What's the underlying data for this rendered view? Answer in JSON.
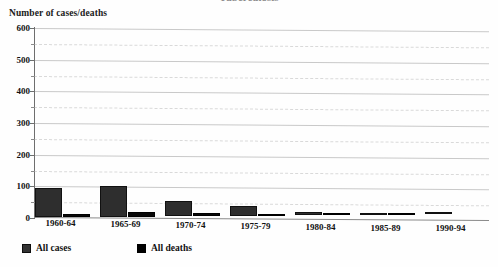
{
  "figure": {
    "title_cropped": "Tuberculosis",
    "y_axis_title": "Number of cases/deaths"
  },
  "legend": {
    "items": [
      {
        "label": "All cases",
        "color": "#333333",
        "key": "cases"
      },
      {
        "label": "All deaths",
        "color": "#000000",
        "key": "deaths"
      }
    ]
  },
  "chart_data": {
    "type": "bar",
    "title": "Tuberculosis",
    "xlabel": "",
    "ylabel": "Number of cases/deaths",
    "ylim": [
      0,
      600
    ],
    "yticks": [
      0,
      100,
      200,
      300,
      400,
      500,
      600
    ],
    "yticks_minor": [
      50,
      150,
      250,
      350,
      450,
      550
    ],
    "grid": true,
    "legend_position": "bottom-left",
    "categories": [
      "1960-64",
      "1965-69",
      "1970-74",
      "1975-79",
      "1980-84",
      "1985-89",
      "1990-94"
    ],
    "series": [
      {
        "name": "All cases",
        "color": "#333333",
        "values": [
          92,
          98,
          48,
          30,
          9,
          7,
          8
        ]
      },
      {
        "name": "All deaths",
        "color": "#000000",
        "values": [
          9,
          14,
          9,
          2,
          1,
          1,
          0
        ]
      }
    ]
  }
}
